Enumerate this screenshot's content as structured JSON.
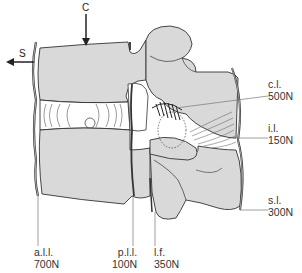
{
  "diagram": {
    "colors": {
      "bone_fill": "#d9d9d9",
      "outline": "#333333",
      "disc_fill": "#ffffff",
      "label_text": "#333333",
      "leader_line": "#777777"
    },
    "loads": [
      {
        "id": "C",
        "label": "C",
        "direction": "down"
      },
      {
        "id": "S",
        "label": "S",
        "direction": "left"
      }
    ],
    "ligaments": [
      {
        "abbr": "a.l.l.",
        "force": "700N"
      },
      {
        "abbr": "p.l.l.",
        "force": "100N"
      },
      {
        "abbr": "l.f.",
        "force": "350N"
      },
      {
        "abbr": "c.l.",
        "force": "500N"
      },
      {
        "abbr": "i.l.",
        "force": "150N"
      },
      {
        "abbr": "s.l.",
        "force": "300N"
      }
    ]
  }
}
